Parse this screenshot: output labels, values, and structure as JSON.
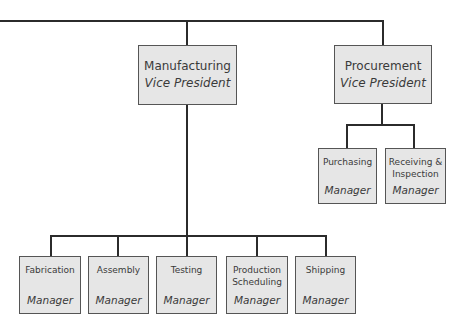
{
  "colors": {
    "line": "#2b2b2b",
    "box_fill": "#e6e6e6",
    "box_border": "#555555",
    "text": "#3a3a3a"
  },
  "org_chart": {
    "vice_presidents": [
      {
        "department": "Manufacturing",
        "title": "Vice President"
      },
      {
        "department": "Procurement",
        "title": "Vice President"
      }
    ],
    "procurement_managers": [
      {
        "department": "Purchasing",
        "title": "Manager"
      },
      {
        "department": "Receiving & Inspection",
        "title": "Manager"
      }
    ],
    "manufacturing_managers": [
      {
        "department": "Fabrication",
        "title": "Manager"
      },
      {
        "department": "Assembly",
        "title": "Manager"
      },
      {
        "department": "Testing",
        "title": "Manager"
      },
      {
        "department": "Production Scheduling",
        "title": "Manager"
      },
      {
        "department": "Shipping",
        "title": "Manager"
      }
    ]
  }
}
